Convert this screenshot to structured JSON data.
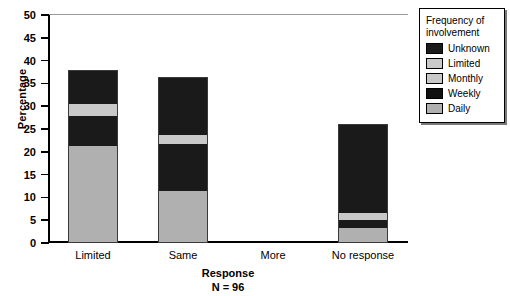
{
  "chart_data": {
    "type": "bar",
    "stacked": true,
    "title": "",
    "xlabel": "Response",
    "xlabel_sub": "N = 96",
    "ylabel": "Percentage",
    "ylim": [
      0,
      50
    ],
    "yticks": [
      0,
      5,
      10,
      15,
      20,
      25,
      30,
      35,
      40,
      45,
      50
    ],
    "grid": false,
    "legend_position": "right-outside",
    "legend_title": "Frequency of involvement",
    "categories": [
      "Limited",
      "Same",
      "More",
      "No response"
    ],
    "series": [
      {
        "name": "Daily",
        "color": "#b0b0b0",
        "values": [
          21.3,
          11.4,
          0,
          3.3
        ]
      },
      {
        "name": "Weekly",
        "color": "#1a1a1a",
        "values": [
          6.6,
          10.3,
          0,
          1.8
        ]
      },
      {
        "name": "Monthly",
        "color": "#c9c9c9",
        "values": [
          0.7,
          0,
          0,
          0
        ]
      },
      {
        "name": "Limited",
        "color": "#c9c9c9",
        "values": [
          1.8,
          2.0,
          0,
          1.5
        ]
      },
      {
        "name": "Unknown",
        "color": "#1a1a1a",
        "values": [
          7.5,
          12.7,
          0,
          19.5
        ]
      }
    ],
    "totals": [
      37.9,
      36.4,
      0,
      26.1
    ]
  },
  "axes": {
    "y_title": "Percentage",
    "y_tick_labels": [
      "50",
      "45",
      "40",
      "35",
      "30",
      "25",
      "20",
      "15",
      "10",
      "5",
      "0"
    ],
    "x_tick_labels": [
      "Limited",
      "Same",
      "More",
      "No response"
    ],
    "x_title": "Response",
    "x_subtitle": "N = 96"
  },
  "legend": {
    "title_line1": "Frequency of",
    "title_line2": "involvement",
    "items": [
      {
        "label": "Unknown",
        "color": "#1a1a1a"
      },
      {
        "label": "Limited",
        "color": "#c9c9c9"
      },
      {
        "label": "Monthly",
        "color": "#c9c9c9"
      },
      {
        "label": "Weekly",
        "color": "#111111"
      },
      {
        "label": "Daily",
        "color": "#b0b0b0"
      }
    ]
  }
}
